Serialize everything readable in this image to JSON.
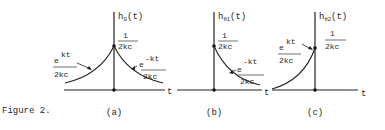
{
  "figure": {
    "caption": "Figure 2.",
    "panels": [
      {
        "id": "a",
        "label": "(a)",
        "ylabel_main": "h",
        "ylabel_sub": "0",
        "ylabel_arg": "(t)",
        "xlabel": "t",
        "peak_num": "1",
        "peak_den": "2kc",
        "left_curve": {
          "base": "e",
          "exp": "kt",
          "den": "2kc"
        },
        "right_curve": {
          "base": "e",
          "exp": "-kt",
          "den": "2kc"
        }
      },
      {
        "id": "b",
        "label": "(b)",
        "ylabel_main": "h",
        "ylabel_sub": "θ1",
        "ylabel_arg": "(t)",
        "xlabel": "t",
        "peak_num": "1",
        "peak_den": "2kc",
        "right_curve": {
          "base": "e",
          "exp": "-kt",
          "den": "2kc"
        }
      },
      {
        "id": "c",
        "label": "(c)",
        "ylabel_main": "h",
        "ylabel_sub": "θ2",
        "ylabel_arg": "(t)",
        "xlabel": "t",
        "peak_num": "1",
        "peak_den": "2kc",
        "left_curve": {
          "base": "e",
          "exp": "kt",
          "den": "2kc"
        }
      }
    ]
  }
}
